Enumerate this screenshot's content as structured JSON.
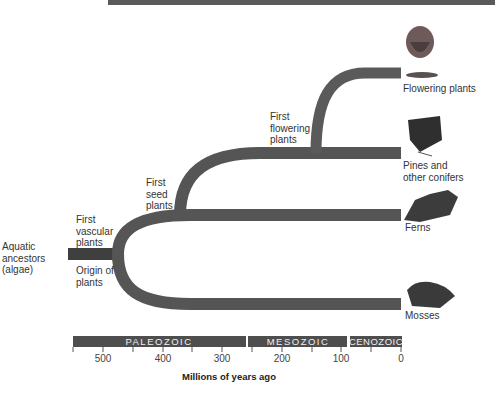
{
  "ancestor_label": "Aquatic ancestors (algae)",
  "events": {
    "origin": "Origin of plants",
    "vascular": "First vascular plants",
    "seed": "First seed plants",
    "flowering": "First flowering plants"
  },
  "groups": [
    {
      "name": "Flowering plants",
      "icon": "flower-icon"
    },
    {
      "name": "Pines and other conifers",
      "icon": "conifer-icon"
    },
    {
      "name": "Ferns",
      "icon": "fern-icon"
    },
    {
      "name": "Mosses",
      "icon": "moss-icon"
    }
  ],
  "eras": [
    {
      "name": "PALEOZOIC",
      "start_mya": 542,
      "end_mya": 251
    },
    {
      "name": "MESOZOIC",
      "start_mya": 251,
      "end_mya": 65
    },
    {
      "name": "CENOZOIC",
      "start_mya": 65,
      "end_mya": 0
    }
  ],
  "axis": {
    "ticks": [
      "500",
      "400",
      "300",
      "200",
      "100",
      "0"
    ],
    "title": "Millions of years ago"
  },
  "colors": {
    "branch": "#555555",
    "era_bar": "#4e4e4e"
  }
}
